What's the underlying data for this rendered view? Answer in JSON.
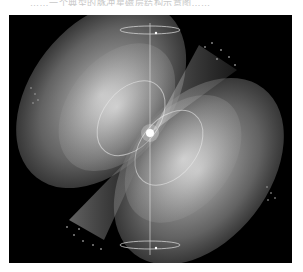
{
  "caption": {
    "text": "……一个典型的脉冲星磁层结构示意图……",
    "note": "top caption text is cropped and illegible"
  },
  "figure": {
    "background_color": "#000000",
    "lobe_color": "#d8d8d8",
    "elements": [
      "top-rotation-ellipse",
      "bottom-rotation-ellipse",
      "rotation-axis",
      "magnetic-field-lobes",
      "radiation-beam-upper-right",
      "radiation-beam-lower-left",
      "central-star"
    ]
  }
}
